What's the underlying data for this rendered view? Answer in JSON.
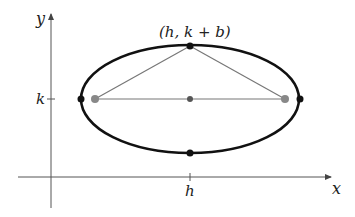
{
  "diagram": {
    "labels": {
      "y_axis": "y",
      "x_axis": "x",
      "k_tick": "k",
      "h_tick": "h",
      "covertex": "(h, k + b)"
    },
    "geometry": {
      "center": [
        190,
        99
      ],
      "rx": 109,
      "ry": 54,
      "foci": [
        [
          95,
          99
        ],
        [
          285,
          99
        ]
      ],
      "vertices": [
        [
          81,
          99
        ],
        [
          299,
          99
        ]
      ],
      "covertices": [
        [
          190,
          45
        ],
        [
          190,
          153
        ]
      ],
      "y_axis_x": 51,
      "x_axis_y": 177
    },
    "colors": {
      "ellipse": "#111111",
      "axis": "#555555",
      "segment": "#777777",
      "focus": "#888888",
      "point": "#111111",
      "center": "#555555"
    }
  }
}
